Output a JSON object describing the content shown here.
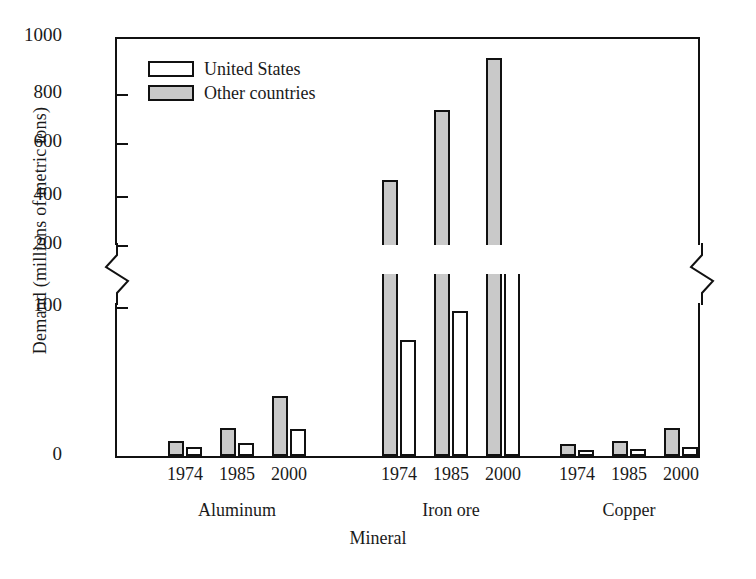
{
  "chart_data": {
    "type": "bar",
    "title": "",
    "xlabel": "Mineral",
    "ylabel": "Demand (millions of metric tons)",
    "grid": false,
    "legend_position": "top-left",
    "axis_break": {
      "lower_max": 100,
      "upper_min": 200,
      "note": "broken y-axis between 100 and 200"
    },
    "y_ticks_lower": [
      0,
      100
    ],
    "y_ticks_upper": [
      200,
      400,
      600,
      800,
      1000
    ],
    "ylim": [
      0,
      1000
    ],
    "categories": [
      "Aluminum",
      "Iron ore",
      "Copper"
    ],
    "subcategories": [
      "1974",
      "1985",
      "2000"
    ],
    "series": [
      {
        "name": "United States",
        "color": "#ffffff",
        "values": {
          "Aluminum": [
            6,
            9,
            18
          ],
          "Iron ore": [
            78,
            97,
            150
          ],
          "Copper": [
            4,
            5,
            6
          ]
        }
      },
      {
        "name": "Other countries",
        "color": "#c9c9c9",
        "values": {
          "Aluminum": [
            10,
            19,
            40
          ],
          "Iron ore": [
            450,
            720,
            920
          ],
          "Copper": [
            8,
            10,
            19
          ]
        }
      }
    ]
  },
  "legend": {
    "items": [
      {
        "label": "United States",
        "swatch": "us"
      },
      {
        "label": "Other countries",
        "swatch": "other"
      }
    ]
  },
  "axes": {
    "y_title": "Demand (millions of metric tons)",
    "x_title": "Mineral",
    "y_tick_labels": [
      "1000",
      "800",
      "600",
      "400",
      "200",
      "100",
      "0"
    ]
  },
  "x_labels": {
    "years": [
      "1974",
      "1985",
      "2000",
      "1974",
      "1985",
      "2000",
      "1974",
      "1985",
      "2000"
    ],
    "groups": [
      "Aluminum",
      "Iron ore",
      "Copper"
    ]
  }
}
